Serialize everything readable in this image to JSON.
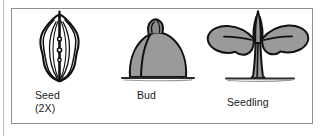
{
  "figure": {
    "name": "plant-growth-stages-diagram",
    "frame": {
      "border_color": "#8e8e8e",
      "background": "#ffffff"
    },
    "palette": {
      "outline": "#111111",
      "fill_gray": "#9a9a9a",
      "fill_gray_dark": "#8a8a8a",
      "fill_white": "#ffffff",
      "ground_line": "#2b2b2b",
      "text": "#1a1a1a"
    },
    "stages": [
      {
        "id": "seed",
        "icon": "seed-icon",
        "label": "Seed",
        "sublabel": "(2X)",
        "fill": "#ffffff",
        "description": "pointed oval seed with vertical ridge lines"
      },
      {
        "id": "bud",
        "icon": "bud-icon",
        "label": "Bud",
        "sublabel": "",
        "fill": "#9a9a9a",
        "description": "gray dome emerging from ground with small knob on top"
      },
      {
        "id": "seedling",
        "icon": "seedling-icon",
        "label": "Seedling",
        "sublabel": "",
        "fill": "#9a9a9a",
        "description": "two broad cotyledon leaves with central pointed shoot on stem"
      }
    ]
  }
}
